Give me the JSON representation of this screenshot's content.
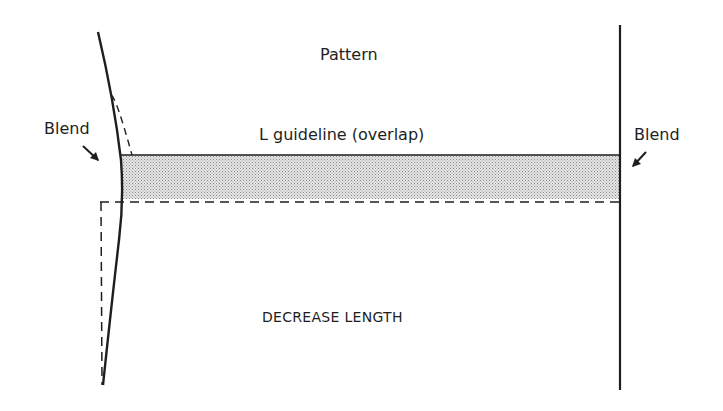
{
  "diagram": {
    "title": "Pattern",
    "guideline_label": "L guideline (overlap)",
    "blend_left_label": "Blend",
    "blend_right_label": "Blend",
    "decrease_label": "DECREASE LENGTH",
    "colors": {
      "line": "#1e1e1e",
      "shade": "#d9d9d9",
      "background": "#ffffff"
    },
    "elements": [
      {
        "type": "curve",
        "name": "left-side-seam",
        "style": "solid"
      },
      {
        "type": "line",
        "name": "right-side-seam",
        "style": "solid"
      },
      {
        "type": "band",
        "name": "overlap-band",
        "style": "shaded"
      },
      {
        "type": "line",
        "name": "new-hemline",
        "style": "dashed"
      },
      {
        "type": "line",
        "name": "original-left-edge",
        "style": "dashed"
      },
      {
        "type": "arrow",
        "name": "blend-arrow-left"
      },
      {
        "type": "arrow",
        "name": "blend-arrow-right"
      }
    ]
  }
}
